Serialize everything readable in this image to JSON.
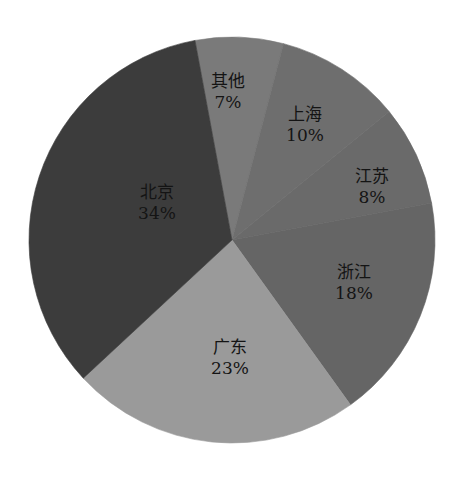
{
  "chart_data": {
    "type": "pie",
    "title": "",
    "start_angle_deg": -10.5,
    "direction": "clockwise",
    "center": [
      232,
      240
    ],
    "radius": 203,
    "categories": [
      "其他",
      "上海",
      "江苏",
      "浙江",
      "广东",
      "北京"
    ],
    "values": [
      7,
      10,
      8,
      18,
      23,
      34
    ],
    "labels": [
      "7%",
      "10%",
      "8%",
      "18%",
      "23%",
      "34%"
    ],
    "colors": [
      "#7a7a7a",
      "#6e6e6e",
      "#6a6a6a",
      "#656565",
      "#9a9a9a",
      "#3c3c3c"
    ],
    "label_positions": [
      [
        228,
        92
      ],
      [
        305,
        125
      ],
      [
        372,
        187
      ],
      [
        354,
        283
      ],
      [
        230,
        358
      ],
      [
        157,
        203
      ]
    ],
    "legend": "none",
    "unit": "%"
  }
}
